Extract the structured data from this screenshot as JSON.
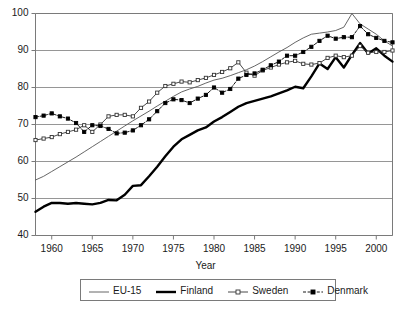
{
  "chart_data": {
    "type": "line",
    "title": "",
    "xlabel": "Year",
    "ylabel": "",
    "xlim": [
      1958,
      2002
    ],
    "ylim": [
      40,
      100
    ],
    "grid": true,
    "legend_position": "bottom",
    "y_ticks": [
      40,
      50,
      60,
      70,
      80,
      90,
      100
    ],
    "x_ticks": [
      1960,
      1965,
      1970,
      1975,
      1980,
      1985,
      1990,
      1995,
      2000
    ],
    "x": [
      1958,
      1959,
      1960,
      1961,
      1962,
      1963,
      1964,
      1965,
      1966,
      1967,
      1968,
      1969,
      1970,
      1971,
      1972,
      1973,
      1974,
      1975,
      1976,
      1977,
      1978,
      1979,
      1980,
      1981,
      1982,
      1983,
      1984,
      1985,
      1986,
      1987,
      1988,
      1989,
      1990,
      1991,
      1992,
      1993,
      1994,
      1995,
      1996,
      1997,
      1998,
      1999,
      2000,
      2001,
      2002
    ],
    "series": [
      {
        "name": "EU-15",
        "marker": "none",
        "width": "thin",
        "color": "#555555",
        "values": [
          55.0,
          56.0,
          57.3,
          58.6,
          59.9,
          61.2,
          62.6,
          64.0,
          65.4,
          66.8,
          68.2,
          69.6,
          71.0,
          72.3,
          73.6,
          75.0,
          76.3,
          77.6,
          78.8,
          79.6,
          80.3,
          81.2,
          82.0,
          82.5,
          83.2,
          84.0,
          84.8,
          85.8,
          87.0,
          88.3,
          89.6,
          90.8,
          92.2,
          93.4,
          94.4,
          94.7,
          95.0,
          95.4,
          96.3,
          100.0,
          97.2,
          95.8,
          94.4,
          92.6,
          91.2
        ]
      },
      {
        "name": "Finland",
        "marker": "none",
        "width": "thick",
        "color": "#000000",
        "values": [
          46.4,
          47.8,
          48.8,
          48.8,
          48.6,
          48.8,
          48.6,
          48.4,
          48.8,
          49.6,
          49.5,
          51.0,
          53.4,
          53.6,
          56.0,
          58.6,
          61.4,
          64.0,
          66.0,
          67.2,
          68.4,
          69.2,
          70.8,
          72.0,
          73.4,
          74.8,
          75.8,
          76.4,
          77.0,
          77.6,
          78.4,
          79.2,
          80.2,
          79.8,
          83.0,
          86.5,
          85.0,
          88.2,
          85.4,
          88.8,
          92.0,
          89.2,
          90.6,
          88.6,
          87.0
        ]
      },
      {
        "name": "Sweden",
        "marker": "open-square",
        "width": "thin",
        "color": "#333333",
        "values": [
          65.8,
          66.2,
          66.6,
          67.4,
          68.0,
          68.6,
          69.8,
          68.0,
          70.0,
          72.2,
          72.6,
          72.6,
          72.2,
          74.5,
          76.2,
          78.6,
          80.4,
          81.0,
          81.6,
          81.4,
          82.0,
          82.6,
          83.4,
          84.2,
          85.2,
          86.8,
          84.0,
          83.2,
          84.6,
          85.4,
          86.2,
          86.8,
          87.2,
          86.4,
          86.2,
          86.6,
          88.0,
          88.6,
          88.2,
          88.6,
          91.2,
          89.4,
          89.6,
          89.6,
          90.0
        ]
      },
      {
        "name": "Denmark",
        "marker": "filled-square",
        "width": "thin-dash",
        "color": "#000000",
        "values": [
          72.0,
          72.4,
          73.0,
          72.2,
          71.6,
          70.4,
          68.0,
          69.8,
          69.6,
          68.8,
          67.6,
          67.8,
          68.4,
          69.8,
          71.4,
          73.6,
          75.8,
          76.8,
          76.6,
          75.8,
          77.0,
          78.0,
          80.0,
          78.6,
          79.6,
          82.4,
          83.4,
          83.8,
          84.8,
          86.0,
          87.0,
          88.6,
          88.6,
          89.6,
          91.0,
          92.6,
          94.0,
          93.2,
          93.6,
          93.6,
          96.6,
          94.4,
          93.4,
          92.6,
          92.2
        ]
      }
    ]
  },
  "axis": {
    "x_title": "Year",
    "y_tick_labels": [
      "100",
      "90",
      "80",
      "70",
      "60",
      "50",
      "40"
    ],
    "x_tick_labels": [
      "1960",
      "1965",
      "1970",
      "1975",
      "1980",
      "1985",
      "1990",
      "1995",
      "2000"
    ]
  },
  "legend": {
    "entries": [
      {
        "label": "EU-15",
        "style": "thin-line"
      },
      {
        "label": "Finland",
        "style": "thick-line"
      },
      {
        "label": "Sweden",
        "style": "open-square-line"
      },
      {
        "label": "Denmark",
        "style": "filled-square-dash-line"
      }
    ]
  },
  "colors": {
    "axis": "#7a7a7a",
    "grid": "#8a8a8a",
    "eu15": "#555555",
    "finland": "#000000",
    "sweden": "#333333",
    "denmark": "#000000",
    "background": "#ffffff"
  }
}
